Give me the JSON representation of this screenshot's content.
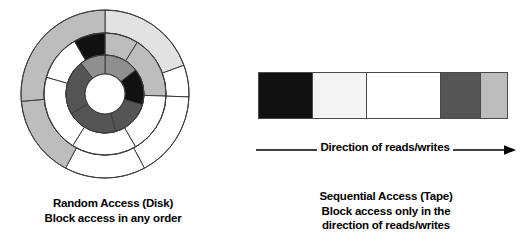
{
  "figure": {
    "background": "#ffffff",
    "stroke": "#3c3c3c"
  },
  "palette": {
    "black": "#111111",
    "dark_gray": "#555555",
    "mid_gray": "#8f8f8f",
    "light_gray": "#bdbdbd",
    "pale_gray": "#e2e2e2",
    "off_white": "#f4f4f4",
    "white": "#ffffff",
    "outline": "#3c3c3c"
  },
  "disk": {
    "name": "random-access-disk-diagram",
    "center": {
      "x": 91,
      "y": 88
    },
    "radii": {
      "outer": 84,
      "ring2": 61,
      "ring3": 39,
      "hub": 20
    },
    "rings": [
      {
        "name": "outer-ring",
        "r_outer": 84,
        "r_inner": 61,
        "segments": [
          {
            "start": -90,
            "end": -20,
            "fill": "#e2e2e2"
          },
          {
            "start": -20,
            "end": 2,
            "fill": "#ffffff"
          },
          {
            "start": 2,
            "end": 62,
            "fill": "#ffffff"
          },
          {
            "start": 62,
            "end": 118,
            "fill": "#ffffff"
          },
          {
            "start": 118,
            "end": 175,
            "fill": "#bdbdbd"
          },
          {
            "start": 175,
            "end": 270,
            "fill": "#bdbdbd"
          }
        ]
      },
      {
        "name": "middle-ring",
        "r_outer": 61,
        "r_inner": 39,
        "segments": [
          {
            "start": -90,
            "end": -58,
            "fill": "#bdbdbd"
          },
          {
            "start": -58,
            "end": 2,
            "fill": "#bdbdbd"
          },
          {
            "start": 2,
            "end": 60,
            "fill": "#ffffff"
          },
          {
            "start": 60,
            "end": 122,
            "fill": "#ffffff"
          },
          {
            "start": 122,
            "end": 196,
            "fill": "#ffffff"
          },
          {
            "start": 196,
            "end": 240,
            "fill": "#ffffff"
          },
          {
            "start": 240,
            "end": 270,
            "fill": "#111111"
          }
        ]
      },
      {
        "name": "inner-ring",
        "r_outer": 39,
        "r_inner": 20,
        "segments": [
          {
            "start": -90,
            "end": -38,
            "fill": "#8f8f8f"
          },
          {
            "start": -38,
            "end": 16,
            "fill": "#111111"
          },
          {
            "start": 16,
            "end": 74,
            "fill": "#555555"
          },
          {
            "start": 74,
            "end": 150,
            "fill": "#555555"
          },
          {
            "start": 150,
            "end": 232,
            "fill": "#555555"
          },
          {
            "start": 232,
            "end": 270,
            "fill": "#8f8f8f"
          }
        ]
      }
    ],
    "hub": {
      "name": "disk-hub",
      "fill": "#ffffff",
      "r": 20
    },
    "caption": {
      "line1": "Random Access (Disk)",
      "line2": "Block access in any order"
    }
  },
  "tape": {
    "name": "sequential-access-tape-diagram",
    "segments": [
      {
        "label": "block-1",
        "fill": "#111111",
        "width_pct": 21.5
      },
      {
        "label": "block-2",
        "fill": "#f4f4f4",
        "width_pct": 21.5
      },
      {
        "label": "block-3",
        "fill": "#ffffff",
        "width_pct": 30.0
      },
      {
        "label": "block-4",
        "fill": "#555555",
        "width_pct": 16.0
      },
      {
        "label": "block-5",
        "fill": "#bdbdbd",
        "width_pct": 11.0
      }
    ],
    "arrow": {
      "label": "Direction of reads/writes",
      "direction": "right"
    },
    "caption": {
      "line1": "Sequential Access (Tape)",
      "line2": "Block access only in the",
      "line3": "direction of reads/writes"
    }
  }
}
